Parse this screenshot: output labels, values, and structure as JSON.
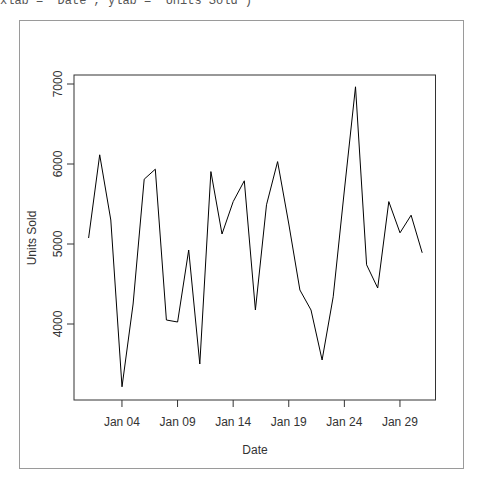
{
  "header": {
    "code_fragment": "xlab = \"Date\", ylab = \"Units Sold\")"
  },
  "chart_data": {
    "type": "line",
    "title": "",
    "xlabel": "Date",
    "ylabel": "Units Sold",
    "x": [
      "Jan 01",
      "Jan 02",
      "Jan 03",
      "Jan 04",
      "Jan 05",
      "Jan 06",
      "Jan 07",
      "Jan 08",
      "Jan 09",
      "Jan 10",
      "Jan 11",
      "Jan 12",
      "Jan 13",
      "Jan 14",
      "Jan 15",
      "Jan 16",
      "Jan 17",
      "Jan 18",
      "Jan 19",
      "Jan 20",
      "Jan 21",
      "Jan 22",
      "Jan 23",
      "Jan 24",
      "Jan 25",
      "Jan 26",
      "Jan 27",
      "Jan 28",
      "Jan 29",
      "Jan 30",
      "Jan 31"
    ],
    "series": [
      {
        "name": "Units Sold",
        "color": "#000000",
        "values": [
          5075,
          6115,
          5300,
          3215,
          4250,
          5810,
          5935,
          4050,
          4025,
          4925,
          3500,
          5905,
          5125,
          5530,
          5790,
          4175,
          5490,
          6030,
          5250,
          4425,
          4175,
          3550,
          4340,
          5675,
          6965,
          4740,
          4450,
          5530,
          5140,
          5360,
          4890
        ]
      }
    ],
    "x_ticks": [
      "Jan 04",
      "Jan 09",
      "Jan 14",
      "Jan 19",
      "Jan 24",
      "Jan 29"
    ],
    "y_ticks": [
      4000,
      5000,
      6000,
      7000
    ],
    "ylim": [
      3050,
      7100
    ],
    "grid": false,
    "legend": "none"
  }
}
